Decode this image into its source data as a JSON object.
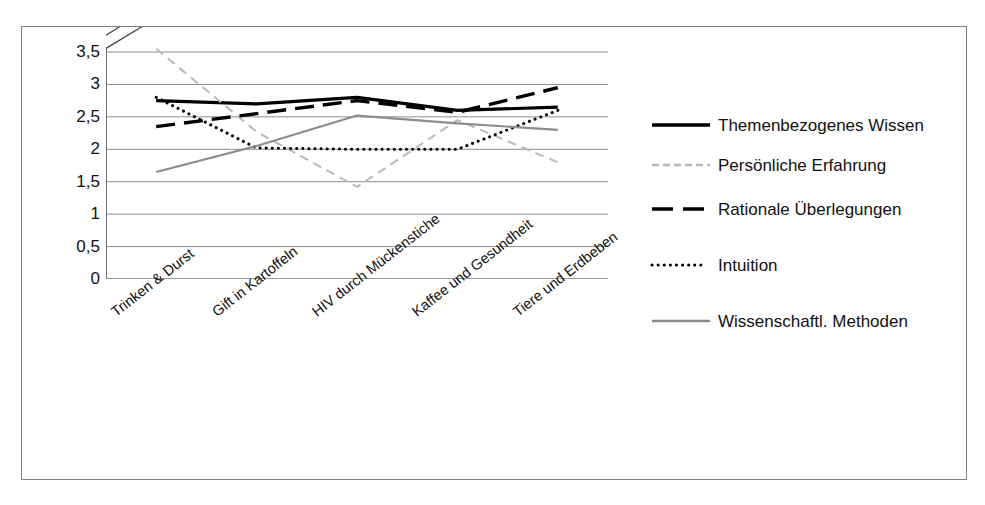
{
  "chart_data": {
    "type": "line",
    "title": "",
    "subtitle": "",
    "xlabel": "",
    "ylabel": "",
    "ylim": [
      0,
      3.5
    ],
    "yticks": [
      "0",
      "0,5",
      "1",
      "1,5",
      "2",
      "2,5",
      "3",
      "3,5"
    ],
    "ytick_values": [
      0,
      0.5,
      1,
      1.5,
      2,
      2.5,
      3,
      3.5
    ],
    "grid": true,
    "legend_position": "right",
    "axis_break": true,
    "decimal_separator": ",",
    "categories": [
      "Trinken & Durst",
      "Gift in Kartoffeln",
      "HIV durch Mückenstiche",
      "Kaffee und Gesundheit",
      "Tiere und Erdbeben"
    ],
    "series": [
      {
        "name": "Themenbezogenes Wissen",
        "style": "solid",
        "color": "#000000",
        "width": 3.2,
        "values": [
          2.75,
          2.7,
          2.8,
          2.6,
          2.65
        ]
      },
      {
        "name": "Persönliche Erfahrung",
        "style": "dashed",
        "color": "#b9b9b9",
        "width": 2.0,
        "values": [
          3.55,
          2.27,
          1.42,
          2.45,
          1.8
        ]
      },
      {
        "name": "Rationale Überlegungen",
        "style": "long-dash",
        "color": "#000000",
        "width": 3.4,
        "values": [
          2.35,
          2.55,
          2.75,
          2.57,
          2.95
        ]
      },
      {
        "name": "Intuition",
        "style": "dotted",
        "color": "#000000",
        "width": 3.0,
        "values": [
          2.8,
          2.02,
          2.0,
          2.0,
          2.6
        ]
      },
      {
        "name": "Wissenschaftl. Methoden",
        "style": "solid-thin",
        "color": "#8c8c8c",
        "width": 2.2,
        "values": [
          1.65,
          2.05,
          2.52,
          2.4,
          2.3
        ]
      }
    ]
  },
  "legend": {
    "items": [
      {
        "label": "Themenbezogenes Wissen"
      },
      {
        "label": "Persönliche Erfahrung"
      },
      {
        "label": "Rationale Überlegungen"
      },
      {
        "label": "Intuition"
      },
      {
        "label": "Wissenschaftl. Methoden"
      }
    ]
  }
}
